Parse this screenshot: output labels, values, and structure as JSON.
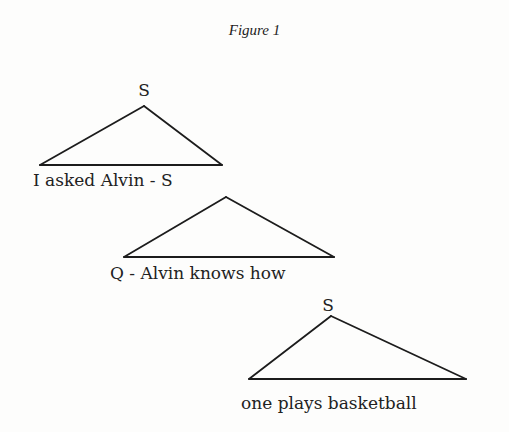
{
  "figure": {
    "title": "Figure 1"
  },
  "tree": {
    "nodes": [
      {
        "id": "top",
        "label": "S",
        "apex": [
          144,
          106
        ],
        "base": [
          [
            40,
            165
          ],
          [
            222,
            165
          ]
        ],
        "yield": "I asked Alvin - S"
      },
      {
        "id": "middle",
        "label": "S",
        "apex": [
          226,
          197
        ],
        "base": [
          [
            124,
            257
          ],
          [
            334,
            257
          ]
        ],
        "yield": "Q - Alvin knows how"
      },
      {
        "id": "bottom",
        "label": "S",
        "apex": [
          331,
          316
        ],
        "base": [
          [
            249,
            379
          ],
          [
            466,
            379
          ]
        ],
        "yield": "one plays basketball"
      }
    ]
  },
  "labels": {
    "top_root": "S",
    "top_yield": "I asked Alvin - S",
    "middle_yield": "Q - Alvin knows how",
    "bottom_root": "S",
    "bottom_yield": "one plays basketball"
  },
  "colors": {
    "ink": "#1c1c1c",
    "paper": "#fdfdfc"
  }
}
